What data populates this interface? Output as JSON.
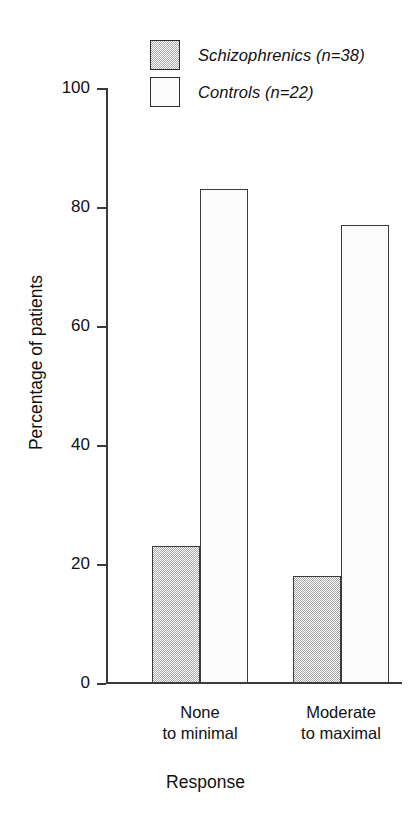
{
  "chart_data": {
    "type": "bar",
    "title": "",
    "subtitle": "",
    "xlabel": "Response",
    "ylabel": "Percentage of patients",
    "categories": [
      "None\nto minimal",
      "Moderate\nto maximal"
    ],
    "category_lines": [
      [
        "None",
        "to minimal"
      ],
      [
        "Moderate",
        "to maximal"
      ]
    ],
    "series": [
      {
        "name": "Schizophrenics (n=38)",
        "values": [
          23,
          18
        ],
        "fill": "#d0d0d0",
        "pattern": "stipple",
        "border": "#3b3b3b"
      },
      {
        "name": "Controls (n=22)",
        "values": [
          83,
          77
        ],
        "fill": "#fbfbfb",
        "pattern": "solid",
        "border": "#3b3b3b"
      }
    ],
    "ylim": [
      0,
      100
    ],
    "yticks": [
      0,
      20,
      40,
      60,
      80,
      100
    ],
    "ytick_labels": [
      "0",
      "20",
      "40",
      "60",
      "80",
      "100"
    ],
    "grid": false,
    "legend_position": "top-center",
    "axis_color": "#3a3a3a"
  },
  "legend": {
    "items": [
      {
        "label": "Schizophrenics (n=38)",
        "swatch": "gray-stipple"
      },
      {
        "label": "Controls (n=22)",
        "swatch": "white"
      }
    ]
  },
  "axes": {
    "y_title": "Percentage of patients",
    "x_title": "Response",
    "y_labels": [
      "100",
      "80",
      "60",
      "40",
      "20",
      "0"
    ]
  },
  "groups": [
    {
      "line1": "None",
      "line2": "to minimal"
    },
    {
      "line1": "Moderate",
      "line2": "to maximal"
    }
  ]
}
